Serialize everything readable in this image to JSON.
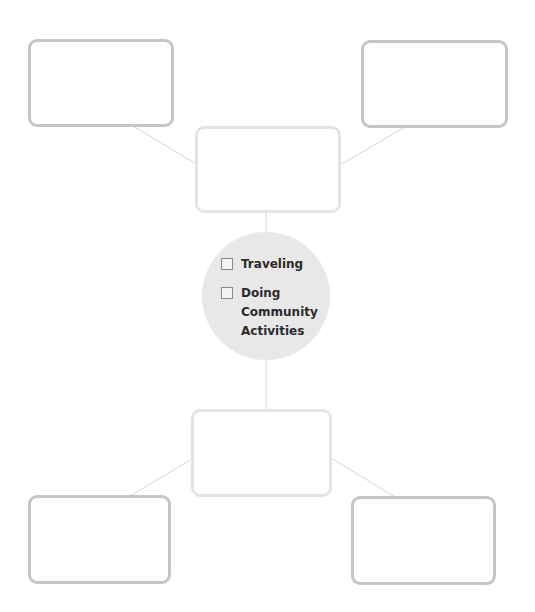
{
  "diagram": {
    "type": "web-organizer",
    "colors": {
      "outer_box_border": "#c6c6c6",
      "inner_box_border": "#e4e4e4",
      "connector": "#d4d4d4",
      "circle_fill": "#e8e8e8",
      "text": "#2b2b2b"
    },
    "center": {
      "options": [
        {
          "label": "Traveling",
          "checked": false
        },
        {
          "label": "Doing Community Activities",
          "label_lines": [
            "Doing",
            "Community",
            "Activities"
          ],
          "checked": false
        }
      ]
    },
    "boxes": {
      "top_left": {
        "text": ""
      },
      "top_right": {
        "text": ""
      },
      "top_center": {
        "text": ""
      },
      "bottom_center": {
        "text": ""
      },
      "bottom_left": {
        "text": ""
      },
      "bottom_right": {
        "text": ""
      }
    }
  }
}
